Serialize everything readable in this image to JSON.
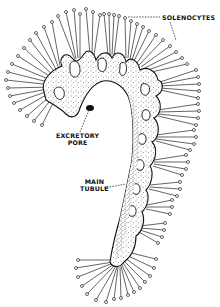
{
  "figure": {
    "background": "#ffffff",
    "ink": "#111111",
    "labels": {
      "solenocytes": "SOLENOCYTES",
      "excretory_pore_line1": "EXCRETORY",
      "excretory_pore_line2": "PORE",
      "main_tubule_line1": "MAIN",
      "main_tubule_line2": "TUBULE"
    }
  }
}
